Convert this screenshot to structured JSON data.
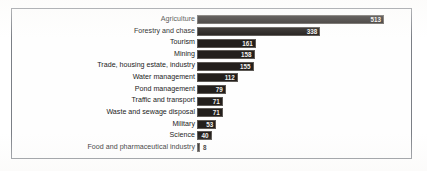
{
  "chart_data": {
    "type": "bar",
    "orientation": "horizontal",
    "title": "",
    "xlabel": "",
    "ylabel": "",
    "grid": false,
    "legend": null,
    "xlim": [
      0,
      513
    ],
    "categories": [
      "Agriculture",
      "Forestry and chase",
      "Tourism",
      "Mining",
      "Trade, housing estate, industry",
      "Water management",
      "Pond management",
      "Traffic and transport",
      "Waste and sewage disposal",
      "Military",
      "Science",
      "Food and pharmaceutical industry"
    ],
    "values": [
      513,
      338,
      161,
      158,
      155,
      112,
      79,
      71,
      71,
      53,
      40,
      8
    ],
    "value_label_position": [
      "inside",
      "inside",
      "inside",
      "inside",
      "inside",
      "inside",
      "inside",
      "inside",
      "inside",
      "inside",
      "inside",
      "outside"
    ],
    "bar_color": "#231f1c",
    "bar_border_color": "#5d5955",
    "label_color": "#1b1b1b",
    "value_label_color": "#f2f0ee",
    "frame_color": "#7b7f86",
    "background_color": "#fefefe"
  }
}
